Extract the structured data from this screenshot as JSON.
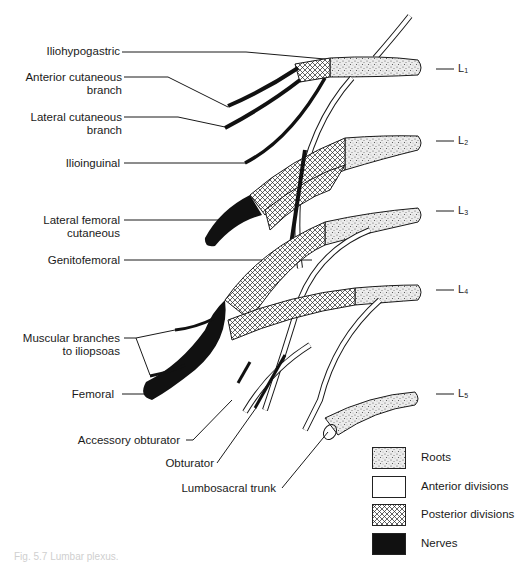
{
  "figure": {
    "caption": "Fig. 5.7 Lumbar plexus.",
    "colors": {
      "nerve": "#111111",
      "root_fill": "#e6e6e6",
      "posterior_fill": "#f2f2f2",
      "anterior_fill": "#ffffff",
      "line": "#1a1a1a"
    }
  },
  "labels": {
    "iliohypogastric": "Iliohypogastric",
    "anterior_cutaneous_1": "Anterior cutaneous",
    "anterior_cutaneous_2": "branch",
    "lateral_cutaneous_1": "Lateral cutaneous",
    "lateral_cutaneous_2": "branch",
    "ilioinguinal": "Ilioinguinal",
    "lateral_femoral_1": "Lateral femoral",
    "lateral_femoral_2": "cutaneous",
    "genitofemoral": "Genitofemoral",
    "muscular_1": "Muscular branches",
    "muscular_2": "to iliopsoas",
    "femoral": "Femoral",
    "accessory_obturator": "Accessory obturator",
    "obturator": "Obturator",
    "lumbosacral_trunk": "Lumbosacral trunk"
  },
  "levels": [
    {
      "main": "L",
      "sub": "1"
    },
    {
      "main": "L",
      "sub": "2"
    },
    {
      "main": "L",
      "sub": "3"
    },
    {
      "main": "L",
      "sub": "4"
    },
    {
      "main": "L",
      "sub": "5"
    }
  ],
  "legend": {
    "items": [
      {
        "label": "Roots",
        "pattern": "stipple"
      },
      {
        "label": "Anterior divisions",
        "pattern": "blank"
      },
      {
        "label": "Posterior divisions",
        "pattern": "crosshatch"
      },
      {
        "label": "Nerves",
        "pattern": "solid"
      }
    ]
  }
}
